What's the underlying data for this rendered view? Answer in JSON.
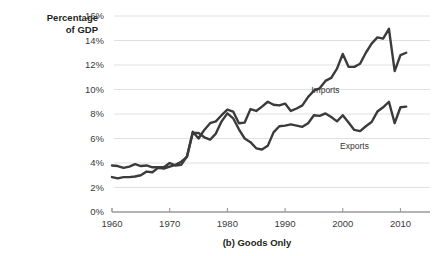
{
  "figure": {
    "caption": "(b) Goods Only",
    "y_axis_label": "Percentage\nof GDP"
  },
  "chart_data": {
    "type": "line",
    "title": "(b) Goods Only",
    "xlabel": "",
    "ylabel": "Percentage of GDP",
    "xlim": [
      1960,
      2012
    ],
    "ylim": [
      0,
      16
    ],
    "ytick_labels": [
      "0%",
      "2%",
      "4%",
      "6%",
      "8%",
      "10%",
      "12%",
      "14%",
      "16%"
    ],
    "ytick_values": [
      0,
      2,
      4,
      6,
      8,
      10,
      12,
      14,
      16
    ],
    "xtick_labels": [
      "1960",
      "1970",
      "1980",
      "1990",
      "2000",
      "2010"
    ],
    "xtick_values": [
      1960,
      1970,
      1980,
      1990,
      2000,
      2010
    ],
    "grid": "horizontal",
    "legend": "inline-annotations",
    "line_color": "#3b3b3b",
    "gridline_color": "#d8d8d8",
    "annotations": [
      {
        "text": "Imports",
        "x": 1998,
        "y": 9.9
      },
      {
        "text": "Exports",
        "x": 2003,
        "y": 5.3
      }
    ],
    "x": [
      1960,
      1961,
      1962,
      1963,
      1964,
      1965,
      1966,
      1967,
      1968,
      1969,
      1970,
      1971,
      1972,
      1973,
      1974,
      1975,
      1976,
      1977,
      1978,
      1979,
      1980,
      1981,
      1982,
      1983,
      1984,
      1985,
      1986,
      1987,
      1988,
      1989,
      1990,
      1991,
      1992,
      1993,
      1994,
      1995,
      1996,
      1997,
      1998,
      1999,
      2000,
      2001,
      2002,
      2003,
      2004,
      2005,
      2006,
      2007,
      2008,
      2009,
      2010,
      2011
    ],
    "series": [
      {
        "name": "Imports",
        "values": [
          2.85,
          2.75,
          2.85,
          2.85,
          2.9,
          3.0,
          3.3,
          3.25,
          3.6,
          3.55,
          3.7,
          3.85,
          4.1,
          4.5,
          6.55,
          6.0,
          6.7,
          7.25,
          7.4,
          7.9,
          8.35,
          8.2,
          7.25,
          7.3,
          8.4,
          8.25,
          8.6,
          9.0,
          8.75,
          8.7,
          8.85,
          8.25,
          8.45,
          8.7,
          9.4,
          9.9,
          10.1,
          10.7,
          10.95,
          11.7,
          12.9,
          11.85,
          11.85,
          12.1,
          13.0,
          13.75,
          14.25,
          14.15,
          14.95,
          11.5,
          12.8,
          13.0
        ]
      },
      {
        "name": "Exports",
        "values": [
          3.8,
          3.75,
          3.6,
          3.7,
          3.9,
          3.75,
          3.8,
          3.65,
          3.65,
          3.65,
          4.0,
          3.8,
          3.85,
          4.55,
          6.45,
          6.45,
          6.1,
          5.9,
          6.4,
          7.4,
          8.05,
          7.65,
          6.75,
          6.0,
          5.7,
          5.2,
          5.1,
          5.4,
          6.5,
          7.0,
          7.05,
          7.15,
          7.05,
          6.95,
          7.25,
          7.9,
          7.85,
          8.05,
          7.75,
          7.4,
          7.9,
          7.3,
          6.7,
          6.6,
          7.0,
          7.35,
          8.2,
          8.55,
          9.0,
          7.25,
          8.55,
          8.6
        ]
      }
    ]
  }
}
